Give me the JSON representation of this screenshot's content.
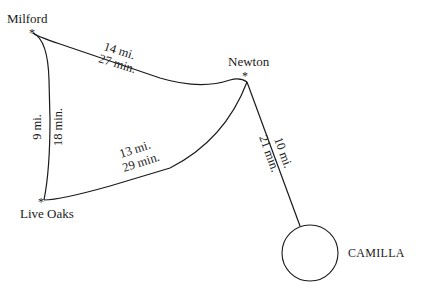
{
  "map": {
    "towns": [
      {
        "id": "milford",
        "name": "Milford"
      },
      {
        "id": "newton",
        "name": "Newton"
      },
      {
        "id": "live_oaks",
        "name": "Live Oaks"
      },
      {
        "id": "camilla",
        "name": "CAMILLA"
      }
    ],
    "marker_symbol": "*",
    "routes": [
      {
        "from": "Milford",
        "to": "Newton",
        "distance": "14 mi.",
        "time": "27 min."
      },
      {
        "from": "Milford",
        "to": "Live Oaks",
        "distance": "9 mi.",
        "time": "18 min."
      },
      {
        "from": "Live Oaks",
        "to": "Newton",
        "distance": "13 mi.",
        "time": "29 min."
      },
      {
        "from": "Newton",
        "to": "Camilla",
        "distance": "10 mi.",
        "time": "21 min."
      }
    ],
    "colors": {
      "ink": "#1a1a1a",
      "background": "#ffffff"
    }
  }
}
